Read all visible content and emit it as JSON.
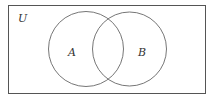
{
  "diagram": {
    "type": "venn",
    "universe_label": "U",
    "sets": [
      {
        "label": "A"
      },
      {
        "label": "B"
      }
    ],
    "colors": {
      "stroke": "#555555",
      "background": "#ffffff",
      "text": "#333333"
    }
  }
}
